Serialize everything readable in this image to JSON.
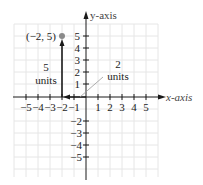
{
  "diagram": {
    "type": "coordinate-plane",
    "axes": {
      "x_label": "x-axis",
      "y_label": "y-axis",
      "x_ticks": [
        "−5",
        "−4",
        "−3",
        "−2",
        "−1",
        "1",
        "2",
        "3",
        "4",
        "5"
      ],
      "y_ticks_positive": [
        "5",
        "4",
        "3",
        "2",
        "1"
      ],
      "y_ticks_negative": [
        "−2",
        "−3",
        "−4",
        "−5"
      ]
    },
    "point": {
      "label": "(−2, 5)",
      "x": -2,
      "y": 5
    },
    "annotations": [
      {
        "id": "vertical",
        "value": "5",
        "unit": "units"
      },
      {
        "id": "horizontal",
        "value": "2",
        "unit": "units"
      }
    ],
    "colors": {
      "grid": "#e6e6e6",
      "axis": "#1a1a1a",
      "point": "#8a8a8a",
      "pointer": "#9a9a9a"
    }
  }
}
